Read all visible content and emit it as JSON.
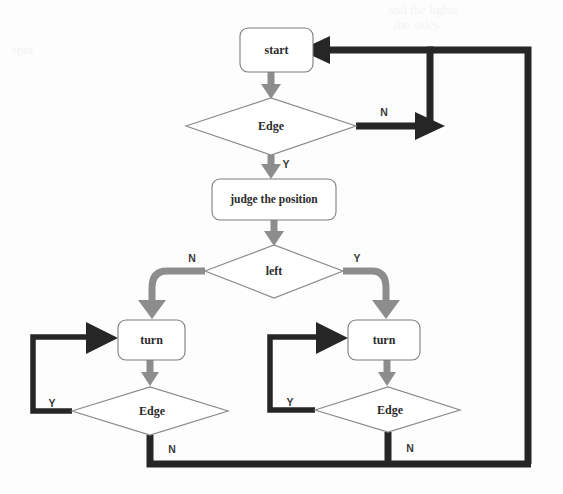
{
  "diagram": {
    "colors": {
      "background": "#fdfdfd",
      "gray_flow": "#8d8d8d",
      "black_flow": "#262626",
      "node_stroke": "#7d7d7d",
      "text": "#2b2b2b"
    },
    "nodes": [
      {
        "id": "start",
        "type": "process",
        "label": "start"
      },
      {
        "id": "edge1",
        "type": "decision",
        "label": "Edge"
      },
      {
        "id": "judge",
        "type": "process",
        "label": "judge the position"
      },
      {
        "id": "left",
        "type": "decision",
        "label": "left"
      },
      {
        "id": "turn-left",
        "type": "process",
        "label": "turn"
      },
      {
        "id": "turn-right",
        "type": "process",
        "label": "turn"
      },
      {
        "id": "edge-left",
        "type": "decision",
        "label": "Edge"
      },
      {
        "id": "edge-right",
        "type": "decision",
        "label": "Edge"
      }
    ],
    "branch_labels": {
      "edge1_no": "N",
      "edge1_yes": "Y",
      "left_no": "N",
      "left_yes": "Y",
      "edge_left_yes": "Y",
      "edge_left_no": "N",
      "edge_right_yes": "Y",
      "edge_right_no": "N"
    },
    "edges": [
      {
        "from": "start",
        "to": "edge1",
        "label": "",
        "style": "gray"
      },
      {
        "from": "edge1",
        "to": "start",
        "label": "N",
        "style": "black"
      },
      {
        "from": "edge1",
        "to": "judge",
        "label": "Y",
        "style": "gray"
      },
      {
        "from": "judge",
        "to": "left",
        "label": "",
        "style": "gray"
      },
      {
        "from": "left",
        "to": "turn-left",
        "label": "N",
        "style": "gray"
      },
      {
        "from": "left",
        "to": "turn-right",
        "label": "Y",
        "style": "gray"
      },
      {
        "from": "turn-left",
        "to": "edge-left",
        "label": "",
        "style": "gray"
      },
      {
        "from": "turn-right",
        "to": "edge-right",
        "label": "",
        "style": "gray"
      },
      {
        "from": "edge-left",
        "to": "turn-left",
        "label": "Y",
        "style": "black"
      },
      {
        "from": "edge-right",
        "to": "turn-right",
        "label": "Y",
        "style": "black"
      },
      {
        "from": "edge-left",
        "to": "start",
        "label": "N",
        "style": "black"
      },
      {
        "from": "edge-right",
        "to": "start",
        "label": "N",
        "style": "black"
      }
    ]
  },
  "ghost_text": {
    "top_right_1": "and the lights",
    "top_right_2": "the sides",
    "left_1": "spot"
  }
}
